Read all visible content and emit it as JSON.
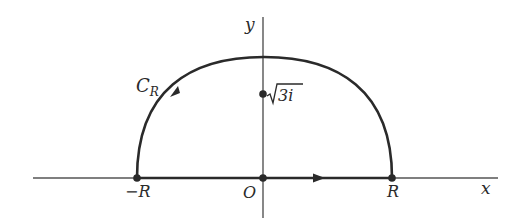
{
  "diagram": {
    "type": "contour-diagram",
    "axes": {
      "x_label": "x",
      "y_label": "y",
      "origin_label": "O"
    },
    "points": {
      "neg_R": "−R",
      "R": "R",
      "origin": "O",
      "singularity_base": "3i",
      "singularity_text": "√3i"
    },
    "contour": {
      "label_main": "C",
      "label_sub": "R",
      "arc_direction": "counterclockwise",
      "segment_direction": "left-to-right"
    },
    "colors": {
      "ink": "#2a2a2a",
      "axis": "#555555",
      "background": "#ffffff"
    }
  }
}
